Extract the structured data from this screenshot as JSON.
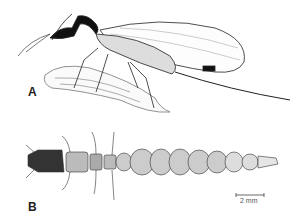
{
  "figure": {
    "panels": [
      {
        "label": "A",
        "subject": "adult-snakefly"
      },
      {
        "label": "B",
        "subject": "snakefly-larva"
      }
    ],
    "scale_bar": {
      "label": "2 mm"
    }
  }
}
